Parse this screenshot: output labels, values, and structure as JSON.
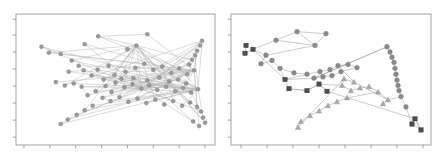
{
  "figure": {
    "title": "",
    "background_color": "#ffffff",
    "panel_count": 2,
    "frame_color": "#8d8d8d",
    "edge_color": "#b9b9b9"
  },
  "chart_data": [
    {
      "type": "scatter",
      "title": "",
      "subtitle": "",
      "xlabel": "",
      "ylabel": "",
      "panel": "left",
      "grid": false,
      "legend": null,
      "xlim": [
        0,
        100
      ],
      "ylim": [
        0,
        100
      ],
      "xticks": [
        4,
        17,
        30,
        43,
        56,
        69,
        82,
        95
      ],
      "yticks": [
        6,
        19,
        32,
        45,
        58,
        71,
        84,
        96
      ],
      "xtick_labels": [],
      "ytick_labels": [],
      "marker": "circle",
      "marker_color": "#9a9a9a",
      "marker_size": 2.1,
      "description": "Dense hairball network: many long edges converge from scattered outlier nodes into a central crossing region and a dense right-edge chain.",
      "series": [
        {
          "name": "nodes",
          "marker": "circle",
          "color": "#9a9a9a",
          "points": [
            [
              41.3,
              83.0
            ],
            [
              66.0,
              84.5
            ],
            [
              34.5,
              77.0
            ],
            [
              60.5,
              76.0
            ],
            [
              16.5,
              70.5
            ],
            [
              22.5,
              69.5
            ],
            [
              12.8,
              75.0
            ],
            [
              56.0,
              73.0
            ],
            [
              28.0,
              64.5
            ],
            [
              31.5,
              60.5
            ],
            [
              34.0,
              57.0
            ],
            [
              26.5,
              56.0
            ],
            [
              41.0,
              57.5
            ],
            [
              46.5,
              60.5
            ],
            [
              38.0,
              53.0
            ],
            [
              44.0,
              50.0
            ],
            [
              49.5,
              53.5
            ],
            [
              55.0,
              56.0
            ],
            [
              60.0,
              59.0
            ],
            [
              64.5,
              62.0
            ],
            [
              69.0,
              57.5
            ],
            [
              73.5,
              60.0
            ],
            [
              78.0,
              55.0
            ],
            [
              82.0,
              58.5
            ],
            [
              86.0,
              54.0
            ],
            [
              89.5,
              57.0
            ],
            [
              91.0,
              72.0
            ],
            [
              90.0,
              68.5
            ],
            [
              88.5,
              65.0
            ],
            [
              87.0,
              61.5
            ],
            [
              92.5,
              76.0
            ],
            [
              93.5,
              79.5
            ],
            [
              45.0,
              45.0
            ],
            [
              50.0,
              47.5
            ],
            [
              54.5,
              44.0
            ],
            [
              58.5,
              46.5
            ],
            [
              63.0,
              43.0
            ],
            [
              67.0,
              45.5
            ],
            [
              71.0,
              42.0
            ],
            [
              75.5,
              44.5
            ],
            [
              80.0,
              41.0
            ],
            [
              84.0,
              43.5
            ],
            [
              88.0,
              40.0
            ],
            [
              91.5,
              42.5
            ],
            [
              40.0,
              41.0
            ],
            [
              36.0,
              38.0
            ],
            [
              33.0,
              44.5
            ],
            [
              29.0,
              47.0
            ],
            [
              24.5,
              45.5
            ],
            [
              20.0,
              48.0
            ],
            [
              43.5,
              36.0
            ],
            [
              47.5,
              33.5
            ],
            [
              52.0,
              36.5
            ],
            [
              56.5,
              33.0
            ],
            [
              61.0,
              35.5
            ],
            [
              65.5,
              32.0
            ],
            [
              70.0,
              34.5
            ],
            [
              74.5,
              31.0
            ],
            [
              79.0,
              33.5
            ],
            [
              83.5,
              30.0
            ],
            [
              87.5,
              32.5
            ],
            [
              91.0,
              29.0
            ],
            [
              93.0,
              25.5
            ],
            [
              94.0,
              21.0
            ],
            [
              95.0,
              17.0
            ],
            [
              92.0,
              14.5
            ],
            [
              89.0,
              18.0
            ],
            [
              38.5,
              30.0
            ],
            [
              34.5,
              26.5
            ],
            [
              30.5,
              23.0
            ],
            [
              26.0,
              19.5
            ],
            [
              22.5,
              16.0
            ],
            [
              48.0,
              40.5
            ],
            [
              53.0,
              50.5
            ],
            [
              59.0,
              51.0
            ],
            [
              66.0,
              49.5
            ],
            [
              72.0,
              51.5
            ],
            [
              77.0,
              48.5
            ],
            [
              81.5,
              50.0
            ],
            [
              85.5,
              47.0
            ]
          ]
        }
      ]
    },
    {
      "type": "scatter",
      "title": "",
      "subtitle": "",
      "xlabel": "",
      "ylabel": "",
      "panel": "right",
      "grid": false,
      "legend": null,
      "xlim": [
        0,
        100
      ],
      "ylim": [
        0,
        100
      ],
      "xticks": [
        5,
        18,
        31,
        44,
        57,
        70,
        83,
        96
      ],
      "yticks": [
        6,
        19,
        32,
        45,
        58,
        71,
        84,
        96
      ],
      "xtick_labels": [],
      "ytick_labels": [],
      "description": "Sparser network with three marker classes: dark squares, gray circles and light triangles, linked into chains and loops.",
      "series": [
        {
          "name": "class-squares",
          "marker": "square",
          "color": "#4d4d4d",
          "points": [
            [
              7.5,
              76.0
            ],
            [
              7.0,
              70.0
            ],
            [
              11.0,
              73.0
            ],
            [
              27.0,
              50.0
            ],
            [
              29.0,
              43.0
            ],
            [
              38.0,
              41.5
            ],
            [
              44.0,
              46.5
            ],
            [
              48.0,
              41.0
            ],
            [
              92.0,
              20.0
            ],
            [
              95.0,
              11.5
            ],
            [
              90.5,
              16.0
            ]
          ]
        },
        {
          "name": "class-circles",
          "marker": "circle",
          "color": "#8a8a8a",
          "points": [
            [
              22.5,
              80.0
            ],
            [
              33.0,
              86.5
            ],
            [
              47.5,
              85.0
            ],
            [
              42.0,
              76.0
            ],
            [
              17.5,
              68.5
            ],
            [
              15.0,
              62.0
            ],
            [
              20.5,
              64.5
            ],
            [
              24.5,
              58.5
            ],
            [
              31.5,
              55.0
            ],
            [
              38.0,
              54.0
            ],
            [
              44.5,
              56.0
            ],
            [
              49.5,
              57.5
            ],
            [
              53.5,
              60.5
            ],
            [
              58.5,
              61.5
            ],
            [
              63.0,
              59.0
            ],
            [
              55.0,
              56.0
            ],
            [
              50.5,
              53.0
            ],
            [
              46.0,
              52.0
            ],
            [
              41.5,
              51.0
            ],
            [
              78.0,
              75.0
            ],
            [
              79.5,
              71.0
            ],
            [
              80.5,
              67.0
            ],
            [
              81.5,
              63.0
            ],
            [
              82.0,
              58.5
            ],
            [
              82.5,
              54.0
            ],
            [
              83.0,
              49.5
            ],
            [
              83.5,
              45.5
            ],
            [
              84.0,
              41.5
            ],
            [
              85.0,
              37.0
            ],
            [
              87.5,
              29.0
            ]
          ]
        },
        {
          "name": "class-triangles",
          "marker": "triangle",
          "color": "#a8a8a8",
          "points": [
            [
              55.5,
              45.5
            ],
            [
              60.0,
              41.5
            ],
            [
              64.5,
              43.5
            ],
            [
              69.0,
              44.5
            ],
            [
              73.5,
              40.5
            ],
            [
              58.0,
              36.0
            ],
            [
              53.0,
              33.0
            ],
            [
              48.5,
              30.0
            ],
            [
              44.0,
              26.0
            ],
            [
              39.5,
              22.5
            ],
            [
              35.0,
              18.0
            ],
            [
              33.5,
              13.5
            ],
            [
              56.5,
              50.5
            ],
            [
              61.5,
              48.0
            ],
            [
              78.5,
              34.5
            ],
            [
              76.0,
              31.5
            ]
          ]
        }
      ]
    }
  ]
}
